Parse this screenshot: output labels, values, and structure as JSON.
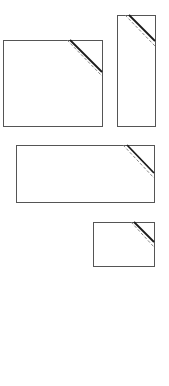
{
  "diagram": {
    "stroke_color": "#555555",
    "corner_line_color": "#1a1a1a",
    "dashed_line_color": "#777777",
    "shapes": [
      {
        "name": "landscape-rectangle",
        "x": 3,
        "y": 40,
        "w": 99,
        "h": 86,
        "corner_solid": {
          "x1": 70,
          "y1": 40,
          "x2": 102,
          "y2": 72
        },
        "corner_dashed": {
          "x1": 67,
          "y1": 40,
          "x2": 102,
          "y2": 76
        }
      },
      {
        "name": "portrait-rectangle",
        "x": 117,
        "y": 15,
        "w": 38,
        "h": 111,
        "corner_solid": {
          "x1": 129,
          "y1": 15,
          "x2": 155,
          "y2": 41
        },
        "corner_dashed": {
          "x1": 125,
          "y1": 15,
          "x2": 155,
          "y2": 46
        }
      },
      {
        "name": "wide-rectangle",
        "x": 16,
        "y": 145,
        "w": 138,
        "h": 57,
        "corner_solid": {
          "x1": 127,
          "y1": 145,
          "x2": 154,
          "y2": 173
        },
        "corner_dashed": {
          "x1": 123,
          "y1": 145,
          "x2": 154,
          "y2": 178
        }
      },
      {
        "name": "small-rectangle",
        "x": 93,
        "y": 222,
        "w": 61,
        "h": 44,
        "corner_solid": {
          "x1": 134,
          "y1": 222,
          "x2": 154,
          "y2": 242
        },
        "corner_dashed": {
          "x1": 131,
          "y1": 222,
          "x2": 154,
          "y2": 247
        }
      }
    ]
  }
}
